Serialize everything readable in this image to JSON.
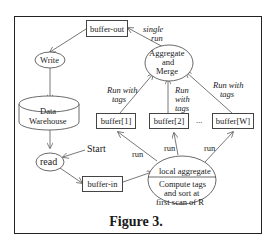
{
  "figure": {
    "caption": "Figure 3.",
    "nodes": {
      "buffer_out": "buffer-out",
      "write": "Write",
      "warehouse_line1": "Data",
      "warehouse_line2": "Warehouse",
      "read": "read",
      "start": "Start",
      "buffer_in": "buffer-in",
      "aggregate_line1": "Aggregate",
      "aggregate_line2": "and",
      "aggregate_line3": "Merge",
      "buffer1": "buffer[1]",
      "buffer2": "buffer[2]",
      "ellipsis": "...",
      "bufferW": "buffer[W]",
      "local_top": "local aggregate",
      "local_line1": "Compute tags",
      "local_line2": "and sort at",
      "local_line3": "first scan of R"
    },
    "edge_labels": {
      "single_run_1": "single",
      "single_run_2": "run",
      "rwt_left_1": "Run with",
      "rwt_left_2": "tags",
      "rwt_mid_1": "Run",
      "rwt_mid_2": "with",
      "rwt_mid_3": "tags",
      "rwt_right_1": "Run with",
      "rwt_right_2": "tags",
      "run1": "run",
      "run2": "run",
      "run3": "run"
    }
  }
}
